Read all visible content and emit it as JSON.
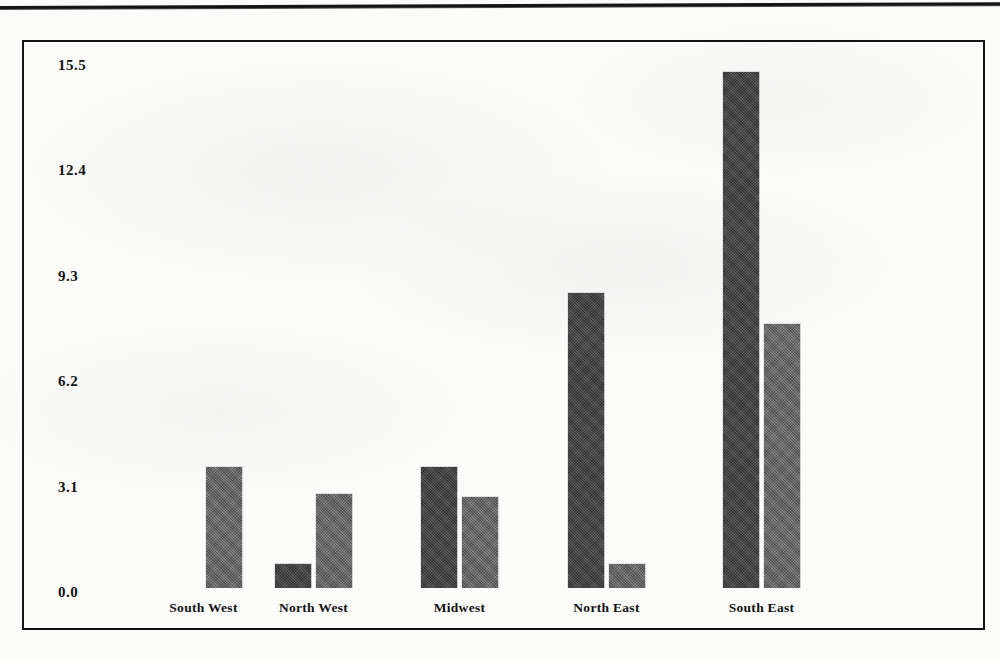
{
  "page": {
    "background_color": "#fbfbfa",
    "has_top_rule": true,
    "frame_color": "#141414"
  },
  "chart_data": {
    "type": "bar",
    "title": "",
    "subtitle": "",
    "xlabel": "",
    "ylabel": "",
    "grid": false,
    "legend": "none",
    "categories": [
      "South West",
      "North West",
      "Midwest",
      "North East",
      "South East"
    ],
    "ytick_labels": [
      "15.5",
      "12.4",
      "9.3",
      "6.2",
      "3.1",
      "0.0"
    ],
    "ytick_values": [
      15.5,
      12.4,
      9.3,
      6.2,
      3.1,
      0.0
    ],
    "ylim": [
      0,
      15.5
    ],
    "series": [
      {
        "name": "series-1",
        "color": "#4d4d4d",
        "values": [
          0.0,
          0.75,
          3.6,
          8.7,
          15.2
        ]
      },
      {
        "name": "series-2",
        "color": "#737373",
        "values": [
          3.6,
          2.8,
          2.7,
          0.75,
          7.8
        ]
      }
    ]
  }
}
